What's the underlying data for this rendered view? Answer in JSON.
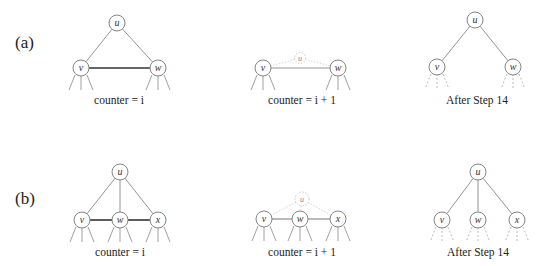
{
  "rows": [
    {
      "label": "(a)",
      "label_pos": [
        15,
        48
      ],
      "panels": [
        {
          "caption": "counter = i",
          "caption_pos": [
            119,
            104
          ],
          "nodes": [
            {
              "id": "u",
              "label": "u",
              "x": 117,
              "y": 23,
              "r": 8,
              "style": "normal"
            },
            {
              "id": "v",
              "label": "v",
              "x": 81,
              "y": 68,
              "r": 8,
              "style": "normal"
            },
            {
              "id": "w",
              "label": "w",
              "x": 158,
              "y": 68,
              "r": 8,
              "style": "normal"
            }
          ],
          "edges": [
            {
              "from": "u",
              "to": "v",
              "style": "edge"
            },
            {
              "from": "u",
              "to": "w",
              "style": "edge"
            },
            {
              "from": "v",
              "to": "w",
              "style": "edge-thick"
            }
          ],
          "stubs": {
            "nodes": [
              "v",
              "w"
            ],
            "style": "stub"
          }
        },
        {
          "caption": "counter = i + 1",
          "caption_pos": [
            302,
            104
          ],
          "nodes": [
            {
              "id": "u",
              "label": "u",
              "x": 300,
              "y": 58,
              "r": 5.5,
              "style": "faint"
            },
            {
              "id": "v",
              "label": "v",
              "x": 263,
              "y": 68,
              "r": 8,
              "style": "normal"
            },
            {
              "id": "w",
              "label": "w",
              "x": 338,
              "y": 68,
              "r": 8,
              "style": "normal"
            }
          ],
          "edges": [
            {
              "from": "u",
              "to": "v",
              "style": "edge-faint"
            },
            {
              "from": "u",
              "to": "w",
              "style": "edge-faint"
            },
            {
              "from": "v",
              "to": "w",
              "style": "edge"
            }
          ],
          "stubs": {
            "nodes": [
              "v",
              "w"
            ],
            "style": "stub"
          }
        },
        {
          "caption": "After Step 14",
          "caption_pos": [
            477,
            104
          ],
          "nodes": [
            {
              "id": "u",
              "label": "u",
              "x": 475,
              "y": 20,
              "r": 8,
              "style": "normal"
            },
            {
              "id": "v",
              "label": "v",
              "x": 437,
              "y": 67,
              "r": 8,
              "style": "normal"
            },
            {
              "id": "w",
              "label": "w",
              "x": 513,
              "y": 67,
              "r": 8,
              "style": "normal"
            }
          ],
          "edges": [
            {
              "from": "u",
              "to": "v",
              "style": "edge"
            },
            {
              "from": "u",
              "to": "w",
              "style": "edge"
            }
          ],
          "stubs": {
            "nodes": [
              "v",
              "w"
            ],
            "style": "stub-dashed"
          }
        }
      ]
    },
    {
      "label": "(b)",
      "label_pos": [
        15,
        204
      ],
      "panels": [
        {
          "caption": "counter = i",
          "caption_pos": [
            120,
            256
          ],
          "nodes": [
            {
              "id": "u",
              "label": "u",
              "x": 120,
              "y": 172,
              "r": 8,
              "style": "normal"
            },
            {
              "id": "v",
              "label": "v",
              "x": 82,
              "y": 220,
              "r": 8,
              "style": "normal"
            },
            {
              "id": "w",
              "label": "w",
              "x": 120,
              "y": 220,
              "r": 8,
              "style": "normal"
            },
            {
              "id": "x",
              "label": "x",
              "x": 158,
              "y": 220,
              "r": 8,
              "style": "normal"
            }
          ],
          "edges": [
            {
              "from": "u",
              "to": "v",
              "style": "edge"
            },
            {
              "from": "u",
              "to": "w",
              "style": "edge"
            },
            {
              "from": "u",
              "to": "x",
              "style": "edge"
            },
            {
              "from": "v",
              "to": "w",
              "style": "edge-thick"
            },
            {
              "from": "w",
              "to": "x",
              "style": "edge-thick"
            }
          ],
          "stubs": {
            "nodes": [
              "v",
              "w",
              "x"
            ],
            "style": "stub"
          }
        },
        {
          "caption": "counter = i + 1",
          "caption_pos": [
            302,
            256
          ],
          "nodes": [
            {
              "id": "u",
              "label": "u",
              "x": 302,
              "y": 199,
              "r": 7,
              "style": "faint"
            },
            {
              "id": "v",
              "label": "v",
              "x": 264,
              "y": 219,
              "r": 8,
              "style": "normal"
            },
            {
              "id": "w",
              "label": "w",
              "x": 300,
              "y": 219,
              "r": 8,
              "style": "normal"
            },
            {
              "id": "x",
              "label": "x",
              "x": 338,
              "y": 219,
              "r": 8,
              "style": "normal"
            }
          ],
          "edges": [
            {
              "from": "u",
              "to": "v",
              "style": "edge-faint"
            },
            {
              "from": "u",
              "to": "w",
              "style": "edge-faint"
            },
            {
              "from": "u",
              "to": "x",
              "style": "edge-faint"
            },
            {
              "from": "v",
              "to": "w",
              "style": "edge-mid"
            },
            {
              "from": "w",
              "to": "x",
              "style": "edge-mid"
            }
          ],
          "stubs": {
            "nodes": [
              "v",
              "w",
              "x"
            ],
            "style": "stub"
          }
        },
        {
          "caption": "After Step 14",
          "caption_pos": [
            478,
            256
          ],
          "nodes": [
            {
              "id": "u",
              "label": "u",
              "x": 478,
              "y": 172,
              "r": 8,
              "style": "normal"
            },
            {
              "id": "v",
              "label": "v",
              "x": 442,
              "y": 220,
              "r": 8,
              "style": "normal"
            },
            {
              "id": "w",
              "label": "w",
              "x": 478,
              "y": 220,
              "r": 8,
              "style": "normal"
            },
            {
              "id": "x",
              "label": "x",
              "x": 517,
              "y": 220,
              "r": 8,
              "style": "normal"
            }
          ],
          "edges": [
            {
              "from": "u",
              "to": "v",
              "style": "edge"
            },
            {
              "from": "u",
              "to": "w",
              "style": "edge"
            },
            {
              "from": "u",
              "to": "x",
              "style": "edge"
            }
          ],
          "stubs": {
            "nodes": [
              "v",
              "w",
              "x"
            ],
            "style": "stub-dashed"
          }
        }
      ]
    }
  ]
}
